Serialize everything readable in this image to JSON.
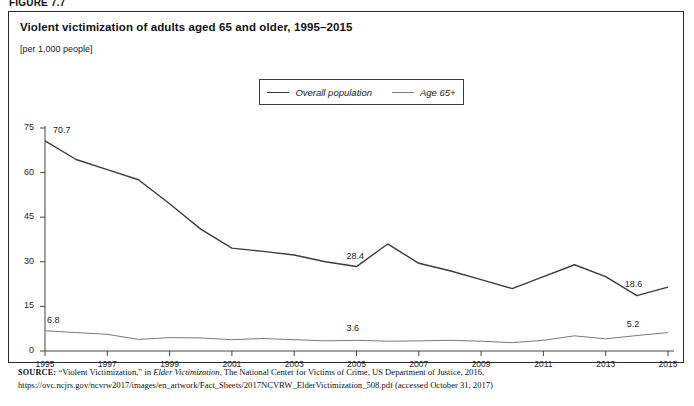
{
  "figure": {
    "label": "FIGURE 7.7",
    "title": "Violent victimization of adults aged 65 and older, 1995–2015",
    "units": "[per 1,000 people]"
  },
  "legend": {
    "items": [
      {
        "label": "Overall population",
        "color": "#3c3c3c"
      },
      {
        "label": "Age 65+",
        "color": "#7a7a7a"
      }
    ]
  },
  "source": {
    "prefix": "SOURCE:",
    "part1": " “Violent Victimization,” in ",
    "italic": "Elder Victimization",
    "part2": ", The National Center for Victims of Crime, US Department of Justice, 2016, https://ovc.ncjrs.gov/ncvrw2017/images/en_artwork/Fact_Sheets/2017NCVRW_ElderVictimization_508.pdf (accessed October 31, 2017)"
  },
  "chart_data": {
    "type": "line",
    "title": "Violent victimization of adults aged 65 and older, 1995–2015",
    "xlabel": "",
    "ylabel": "[per 1,000 people]",
    "ylim": [
      0,
      75
    ],
    "yticks": [
      0,
      15,
      30,
      45,
      60,
      75
    ],
    "xticks": [
      "1995",
      "1997",
      "1999",
      "2001",
      "2003",
      "2005",
      "2007",
      "2009",
      "2011",
      "2013",
      "2015"
    ],
    "grid": false,
    "legend_position": "top-center",
    "x": [
      1995,
      1996,
      1997,
      1998,
      1999,
      2000,
      2001,
      2002,
      2003,
      2004,
      2005,
      2006,
      2007,
      2008,
      2009,
      2010,
      2011,
      2012,
      2013,
      2014,
      2015
    ],
    "series": [
      {
        "name": "Overall population",
        "color": "#3c3c3c",
        "values": [
          70.7,
          64.4,
          61.0,
          57.6,
          49.5,
          41.0,
          34.6,
          33.5,
          32.3,
          30.0,
          28.4,
          36.0,
          29.5,
          27.0,
          24.0,
          21.0,
          25.0,
          29.0,
          25.0,
          18.6,
          21.5
        ]
      },
      {
        "name": "Age 65+",
        "color": "#7a7a7a",
        "values": [
          6.8,
          6.2,
          5.6,
          3.9,
          4.5,
          4.4,
          3.8,
          4.2,
          3.8,
          3.4,
          3.6,
          3.3,
          3.4,
          3.6,
          3.3,
          2.8,
          3.6,
          5.1,
          4.1,
          5.2,
          6.2
        ]
      }
    ],
    "point_labels": [
      {
        "series": "Overall population",
        "x": 1995,
        "value": "70.7"
      },
      {
        "series": "Overall population",
        "x": 2005,
        "value": "28.4"
      },
      {
        "series": "Overall population",
        "x": 2014,
        "value": "18.6"
      },
      {
        "series": "Age 65+",
        "x": 1995,
        "value": "6.8"
      },
      {
        "series": "Age 65+",
        "x": 2005,
        "value": "3.6"
      },
      {
        "series": "Age 65+",
        "x": 2014,
        "value": "5.2"
      }
    ]
  }
}
